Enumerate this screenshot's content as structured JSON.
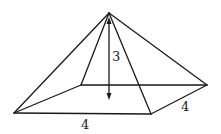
{
  "figure": {
    "type": "square-pyramid",
    "labels": {
      "height": "3",
      "base_front": "4",
      "base_side": "4"
    },
    "colors": {
      "line": "#1a1a1a",
      "background": "#ffffff"
    }
  }
}
